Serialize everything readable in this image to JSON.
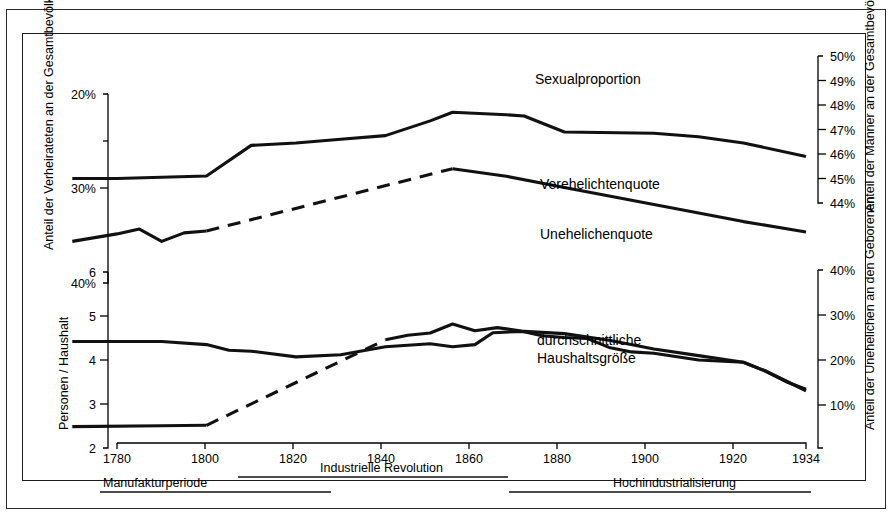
{
  "figure": {
    "kind": "historical-line-chart",
    "language": "de",
    "background": "#ffffff",
    "ink_color": "#111111"
  },
  "axes": {
    "x": {
      "label": "",
      "ticks": [
        1780,
        1800,
        1820,
        1840,
        1860,
        1880,
        1900,
        1920,
        1934
      ],
      "tick_labels": [
        "1780",
        "1800",
        "1820",
        "1840",
        "1860",
        "1880",
        "1900",
        "1920",
        "1934"
      ],
      "range": [
        1770,
        1934
      ]
    },
    "y_left_top": {
      "title": "Anteil der Verheirateten an der Gesamtbevölkerung",
      "tick_labels": [
        "20%",
        "30%",
        "40%"
      ],
      "ticks": [
        20,
        30,
        40
      ],
      "minor_ticks": [
        25,
        35
      ],
      "inverted": true,
      "range": [
        20,
        40
      ]
    },
    "y_left_bottom": {
      "title": "Personen / Haushalt",
      "tick_labels": [
        "6",
        "5",
        "4",
        "3",
        "2"
      ],
      "ticks": [
        6,
        5,
        4,
        3,
        2
      ],
      "range": [
        2,
        6
      ]
    },
    "y_right_top": {
      "title": "Anteil der Männer an der Gesamtbevölkerung",
      "tick_labels": [
        "50%",
        "49%",
        "48%",
        "47%",
        "46%",
        "45%",
        "44%"
      ],
      "ticks": [
        50,
        49,
        48,
        47,
        46,
        45,
        44
      ],
      "range": [
        44,
        50
      ]
    },
    "y_right_bottom": {
      "title": "Anteil der Unehelichen an den Geborenen",
      "tick_labels": [
        "40%",
        "30%",
        "20%",
        "10%"
      ],
      "ticks": [
        40,
        30,
        20,
        10
      ],
      "range": [
        5,
        43
      ]
    }
  },
  "series_labels": {
    "sexualproportion": "Sexualproportion",
    "verehelichtenquote": "Verehelichtenquote",
    "unehelichenquote": "Unehelichenquote",
    "haushaltsgroesse_line1": "durchschnittliche",
    "haushaltsgroesse_line2": "Haushaltsgröße"
  },
  "periods": [
    {
      "label": "Manufakturperiode",
      "start": 1770,
      "end": 1812
    },
    {
      "label": "Industrielle Revolution",
      "start": 1800,
      "end": 1873
    },
    {
      "label": "Hochindustrialisierung",
      "start": 1866,
      "end": 1934
    }
  ],
  "chart_data": {
    "type": "line",
    "title": "",
    "xlabel": "",
    "ylabel": "",
    "grid": false,
    "legend": "inline-annotations",
    "xlim": [
      1770,
      1934
    ],
    "series": [
      {
        "name": "Sexualproportion",
        "axis": "y_right_top",
        "unit": "% Männer an der Gesamtbevölkerung",
        "ylim": [
          44,
          50
        ],
        "style": "solid",
        "x": [
          1770,
          1780,
          1790,
          1800,
          1810,
          1820,
          1830,
          1840,
          1850,
          1855,
          1867,
          1871,
          1880,
          1900,
          1910,
          1920,
          1934
        ],
        "y": [
          45.0,
          45.0,
          45.05,
          45.1,
          46.35,
          46.45,
          46.6,
          46.75,
          47.35,
          47.7,
          47.6,
          47.55,
          46.9,
          46.85,
          46.7,
          46.45,
          45.9
        ]
      },
      {
        "name": "Verehelichtenquote",
        "axis": "y_left_top",
        "unit": "% Verheiratete an der Gesamtbevölkerung",
        "ylim": [
          20,
          40
        ],
        "style": "solid-with-dashed-interpolation",
        "dashed_segment": [
          1800,
          1855
        ],
        "x": [
          1770,
          1780,
          1785,
          1790,
          1795,
          1800,
          1855,
          1867,
          1880,
          1900,
          1920,
          1934
        ],
        "y": [
          35.6,
          34.8,
          34.3,
          35.6,
          34.7,
          34.5,
          27.9,
          28.7,
          29.9,
          31.7,
          33.5,
          34.6
        ]
      },
      {
        "name": "Unehelichenquote",
        "axis": "y_right_bottom",
        "unit": "% Uneheliche an den Geborenen",
        "ylim": [
          5,
          43
        ],
        "style": "solid-with-dashed-interpolation",
        "dashed_segment": [
          1800,
          1840
        ],
        "x": [
          1770,
          1790,
          1800,
          1840,
          1845,
          1850,
          1855,
          1860,
          1865,
          1870,
          1875,
          1880,
          1885,
          1890,
          1895,
          1900,
          1910,
          1920,
          1925,
          1930,
          1934
        ],
        "y": [
          5.2,
          5.4,
          5.5,
          24.5,
          25.5,
          26.0,
          28.0,
          26.5,
          27.2,
          26.5,
          25.4,
          25.0,
          24.8,
          22.8,
          21.8,
          21.5,
          20.0,
          19.5,
          17.5,
          15.0,
          13.5
        ]
      },
      {
        "name": "durchschnittliche Haushaltsgröße",
        "axis": "y_left_bottom",
        "unit": "Personen pro Haushalt",
        "ylim": [
          2,
          6
        ],
        "style": "solid",
        "x": [
          1770,
          1790,
          1800,
          1805,
          1810,
          1820,
          1830,
          1840,
          1850,
          1855,
          1860,
          1864,
          1871,
          1880,
          1890,
          1900,
          1910,
          1920,
          1925,
          1930,
          1934
        ],
        "y": [
          4.42,
          4.42,
          4.35,
          4.22,
          4.2,
          4.07,
          4.12,
          4.3,
          4.37,
          4.3,
          4.35,
          4.62,
          4.65,
          4.6,
          4.45,
          4.25,
          4.1,
          3.95,
          3.75,
          3.5,
          3.3
        ]
      }
    ]
  }
}
